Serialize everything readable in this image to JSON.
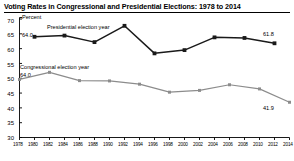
{
  "chart_data": {
    "type": "line",
    "title": "Voting Rates in Congressional and Presidential Elections: 1978 to 2014",
    "xlabel": "",
    "ylabel": "Percent",
    "ylim": [
      30,
      70
    ],
    "yticks": [
      30,
      35,
      40,
      45,
      50,
      55,
      60,
      65,
      70
    ],
    "grid": false,
    "legend_position": "inline-annotations",
    "x": [
      1978,
      1980,
      1982,
      1984,
      1986,
      1988,
      1990,
      1992,
      1994,
      1996,
      1998,
      2000,
      2002,
      2004,
      2006,
      2008,
      2010,
      2012,
      2014
    ],
    "xticklabels": [
      "1978",
      "1980",
      "1982",
      "1984",
      "1986",
      "1988",
      "1990",
      "1992",
      "1994",
      "1996",
      "1998",
      "2000",
      "2002",
      "2004",
      "2006",
      "2008",
      "2010",
      "2012",
      "2014"
    ],
    "series": [
      {
        "name": "Presidential election year",
        "color": "#1a1a1a",
        "x": [
          1980,
          1984,
          1988,
          1992,
          1996,
          2000,
          2004,
          2008,
          2012
        ],
        "values": [
          64.0,
          64.4,
          62.2,
          67.7,
          58.4,
          59.5,
          63.8,
          63.6,
          61.8
        ]
      },
      {
        "name": "Congressional election year",
        "color": "#8c8c8c",
        "x": [
          1978,
          1982,
          1986,
          1990,
          1994,
          1998,
          2002,
          2006,
          2010,
          2014
        ],
        "values": [
          49.6,
          52.0,
          49.2,
          49.1,
          48.0,
          45.3,
          45.9,
          47.8,
          46.4,
          41.9
        ]
      }
    ],
    "annotations": [
      {
        "text": "Presidential election year",
        "series": "Presidential election year"
      },
      {
        "text": "64.0",
        "series": "Presidential election year",
        "point_year": 1980,
        "point_value": 64.0
      },
      {
        "text": "61.8",
        "series": "Presidential election year",
        "point_year": 2012,
        "point_value": 61.8
      },
      {
        "text": "Congressional election year",
        "series": "Congressional election year"
      },
      {
        "text": "64.0",
        "series": "Congressional election year",
        "point_year": 1978,
        "point_value": 49.6
      },
      {
        "text": "41.9",
        "series": "Congressional election year",
        "point_year": 2014,
        "point_value": 41.9
      }
    ]
  },
  "labels": {
    "y_unit": "Percent",
    "presidential_series_label": "Presidential election year",
    "presidential_start_value": "64.0",
    "presidential_end_value": "61.8",
    "congressional_series_label": "Congressional election year",
    "congressional_start_value": "64.0",
    "congressional_end_value": "41.9"
  },
  "colors": {
    "presidential": "#1a1a1a",
    "congressional": "#8c8c8c",
    "axis": "#000000",
    "background": "#ffffff"
  }
}
